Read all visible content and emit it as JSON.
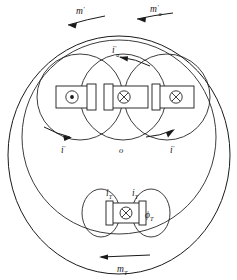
{
  "figure": {
    "background_color": "#ffffff",
    "line_color": "#1a1a1a",
    "width": 237,
    "height": 280
  },
  "labels": {
    "top_left_moment": {
      "base": "m",
      "prime": "′",
      "sub": ""
    },
    "top_right_moment": {
      "base": "m",
      "prime": "′",
      "sub": "a"
    },
    "upper_center_current": {
      "base": "i",
      "prime": "′",
      "sub": "a"
    },
    "left_current": {
      "base": "i",
      "prime": "′",
      "sub": ""
    },
    "right_current": {
      "base": "i",
      "prime": "′",
      "sub": ""
    },
    "origin": {
      "base": "o",
      "prime": "",
      "sub": ""
    },
    "lower_left_current": {
      "base": "i",
      "prime": "",
      "sub": "T"
    },
    "lower_right_current": {
      "base": "i",
      "prime": "",
      "sub": "T"
    },
    "flux": {
      "base": "ϕ",
      "prime": "",
      "sub": "T"
    },
    "bottom_moment": {
      "base": "m",
      "prime": "",
      "sub": "T"
    }
  },
  "coils": [
    {
      "name": "left-coil",
      "marker": "dot",
      "marker_symbol": "⊙",
      "cx": 78,
      "cy": 97
    },
    {
      "name": "center-coil",
      "marker": "cross",
      "marker_symbol": "⊗",
      "cx": 122,
      "cy": 97
    },
    {
      "name": "right-coil",
      "marker": "cross",
      "marker_symbol": "⊗",
      "cx": 173,
      "cy": 97
    },
    {
      "name": "lower-coil",
      "marker": "cross",
      "marker_symbol": "⊗",
      "cx": 123,
      "cy": 213
    }
  ],
  "field_loops": [
    {
      "name": "outer-boundary-loop",
      "cx": 119,
      "cy": 155,
      "rx": 111,
      "ry": 120
    },
    {
      "name": "armature-envelope-loop",
      "cx": 119,
      "cy": 135,
      "rx": 97,
      "ry": 98
    },
    {
      "name": "left-field-loop",
      "cx": 80,
      "cy": 97,
      "r": 43
    },
    {
      "name": "center-field-loop",
      "cx": 122,
      "cy": 97,
      "r": 43
    },
    {
      "name": "right-field-loop",
      "cx": 166,
      "cy": 97,
      "r": 43
    },
    {
      "name": "lower-left-field-loop",
      "cx": 101,
      "cy": 213,
      "rx": 19,
      "ry": 24
    },
    {
      "name": "lower-right-field-loop",
      "cx": 151,
      "cy": 213,
      "rx": 19,
      "ry": 24
    }
  ],
  "arrows": [
    {
      "name": "top-left-moment-arrow",
      "direction": "left"
    },
    {
      "name": "top-right-moment-arrow",
      "direction": "left"
    },
    {
      "name": "upper-center-current-arrow",
      "direction": "left"
    },
    {
      "name": "left-current-arrow",
      "direction": "right"
    },
    {
      "name": "right-current-arrow",
      "direction": "right"
    },
    {
      "name": "bottom-moment-arrow",
      "direction": "left"
    }
  ]
}
